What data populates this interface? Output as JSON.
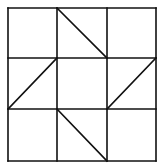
{
  "diagram": {
    "type": "quilt-block-grid",
    "rows": 3,
    "cols": 3,
    "stroke_color": "#111111",
    "background": "#ffffff",
    "grid_x": [
      8,
      57,
      107,
      156
    ],
    "grid_y": [
      8,
      58,
      109,
      161
    ],
    "diagonals": [
      {
        "cell": "top-middle",
        "x1": 57,
        "y1": 8,
        "x2": 107,
        "y2": 58
      },
      {
        "cell": "middle-left",
        "x1": 8,
        "y1": 109,
        "x2": 57,
        "y2": 58
      },
      {
        "cell": "middle-right",
        "x1": 107,
        "y1": 109,
        "x2": 156,
        "y2": 58
      },
      {
        "cell": "bottom-middle",
        "x1": 57,
        "y1": 109,
        "x2": 107,
        "y2": 161
      }
    ]
  }
}
